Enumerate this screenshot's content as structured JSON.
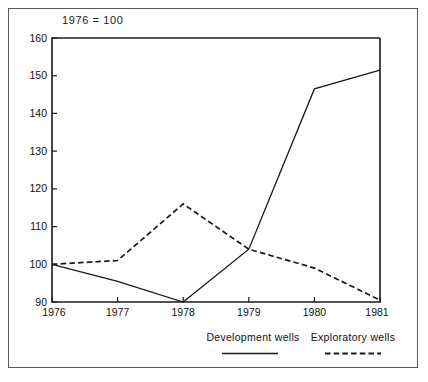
{
  "frame": {
    "name": "figure-border"
  },
  "chart_data": {
    "type": "line",
    "title": "1976  =  100",
    "xlabel": "",
    "ylabel": "",
    "x": [
      "1976",
      "1977",
      "1978",
      "1979",
      "1980",
      "1981"
    ],
    "categories": [
      "1976",
      "1977",
      "1978",
      "1979",
      "1980",
      "1981"
    ],
    "xticklabels": [
      "1976",
      "1977",
      "1978",
      "1979",
      "1980",
      "1981"
    ],
    "yticklabels": [
      "90",
      "100",
      "110",
      "120",
      "130",
      "140",
      "150",
      "160"
    ],
    "yticks": [
      90,
      100,
      110,
      120,
      130,
      140,
      150,
      160
    ],
    "ylim": [
      90,
      160
    ],
    "grid": false,
    "legend_position": "bottom",
    "series": [
      {
        "name": "Development wells",
        "style": "solid",
        "color": "#1a1a1a",
        "values": [
          100,
          95.5,
          90,
          104,
          146.5,
          151.5
        ]
      },
      {
        "name": "Exploratory wells",
        "style": "dashed",
        "color": "#1a1a1a",
        "values": [
          100,
          101,
          116,
          104,
          99,
          90.5
        ]
      }
    ]
  },
  "legend": {
    "items": [
      {
        "label": "Development wells",
        "style": "solid"
      },
      {
        "label": "Exploratory wells",
        "style": "dashed"
      }
    ]
  }
}
